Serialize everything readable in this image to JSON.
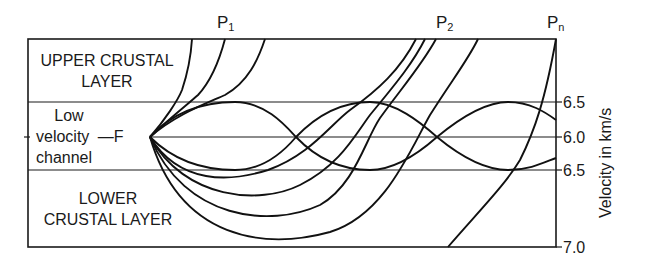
{
  "diagram": {
    "layers": {
      "upper": "UPPER CRUSTAL LAYER",
      "upper_line1": "UPPER CRUSTAL",
      "upper_line2": "LAYER",
      "channel_line1": "Low",
      "channel_line2": "velocity",
      "channel_line3": "channel",
      "focus_marker": "—F",
      "lower_line1": "LOWER",
      "lower_line2": "CRUSTAL LAYER"
    },
    "phases": [
      {
        "name": "P",
        "sub": "1"
      },
      {
        "name": "P",
        "sub": "2"
      },
      {
        "name": "P",
        "sub": "n"
      }
    ],
    "velocity_axis": {
      "title": "Velocity in km/s",
      "ticks": [
        "6.5",
        "6.0",
        "6.5",
        "7.0"
      ]
    },
    "colors": {
      "ink": "#1a1a1a",
      "background": "#ffffff"
    }
  }
}
